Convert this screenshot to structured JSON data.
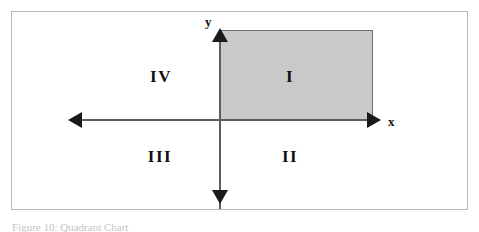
{
  "figure": {
    "caption": "Figure 10: Quadrant Chart",
    "frame_border_color": "#b9b9b9"
  },
  "axes": {
    "x_label": "x",
    "y_label": "y",
    "line_color": "#5d5d5d",
    "arrow_color": "#1a1a1a"
  },
  "shaded_region": {
    "fill_color": "#c9c9c9",
    "stroke_color": "#6f6f6f",
    "quadrant": "I"
  },
  "quadrants": [
    {
      "id": "i",
      "label": "I"
    },
    {
      "id": "ii",
      "label": "II"
    },
    {
      "id": "iii",
      "label": "III"
    },
    {
      "id": "iv",
      "label": "IV"
    }
  ],
  "chart_data": {
    "type": "diagram",
    "title": "Figure 10: Quadrant Chart",
    "xlabel": "x",
    "ylabel": "y",
    "grid": false,
    "legend": "none",
    "quadrant_labels": [
      "I",
      "II",
      "III",
      "IV"
    ],
    "quadrant_positions": {
      "I": "upper-right",
      "II": "lower-right",
      "III": "lower-left",
      "IV": "upper-left"
    },
    "shaded_rectangle": {
      "quadrant": "I",
      "x_range": [
        0,
        1
      ],
      "y_range": [
        0,
        1
      ],
      "fill": "#c9c9c9"
    }
  }
}
